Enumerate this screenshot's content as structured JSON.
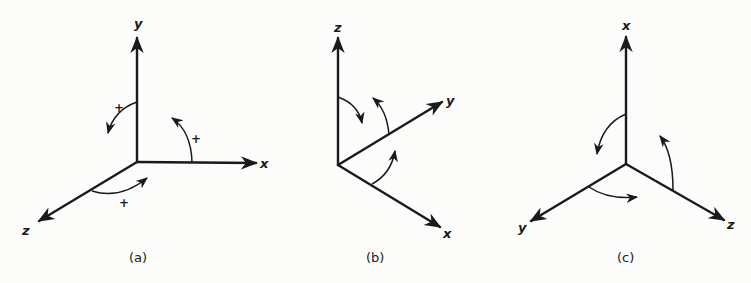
{
  "figure": {
    "panels": [
      {
        "id": "a",
        "caption": "(a)",
        "axes": {
          "up": "y",
          "right": "x",
          "down_left": "z"
        },
        "rotation_signs": [
          "+",
          "+",
          "+"
        ]
      },
      {
        "id": "b",
        "caption": "(b)",
        "axes": {
          "up": "z",
          "up_right": "y",
          "down_right": "x"
        }
      },
      {
        "id": "c",
        "caption": "(c)",
        "axes": {
          "up": "x",
          "down_left": "y",
          "down_right": "z"
        }
      }
    ],
    "colors": {
      "ink": "#1a1a1a",
      "paper": "#fcfcfb"
    }
  }
}
